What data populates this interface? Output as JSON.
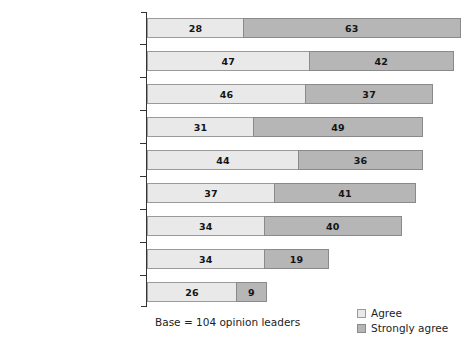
{
  "chart_data": {
    "type": "bar",
    "orientation": "horizontal",
    "stacked": true,
    "title": "",
    "subtitle": "",
    "xlabel": "",
    "ylabel": "",
    "grid": false,
    "axis_visible": "category-axis-only",
    "xlim": [
      0,
      100
    ],
    "legend_position": "bottom-right",
    "categories": [
      "Reliable products\nand services",
      "Transparency",
      "Being prepared to\nadmit mistakes",
      "Treating employees\nwell",
      "Establishing genuine\ndialogue with stakeholders",
      "Clear leadership",
      "Strong leadership",
      "Clearly defined whistle-\nblowing system",
      "Humility"
    ],
    "series": [
      {
        "name": "Agree",
        "color": "#e9e9e9",
        "values": [
          28,
          47,
          46,
          31,
          44,
          37,
          34,
          34,
          26
        ]
      },
      {
        "name": "Strongly agree",
        "color": "#b6b6b6",
        "values": [
          63,
          42,
          37,
          49,
          36,
          41,
          40,
          19,
          9
        ]
      }
    ],
    "totals": [
      91,
      89,
      83,
      80,
      80,
      78,
      74,
      53,
      35
    ],
    "annotations": {
      "base_note": "Base = 104 opinion leaders"
    }
  },
  "legend": {
    "items": [
      {
        "label": "Agree",
        "swatch": "agree"
      },
      {
        "label": "Strongly agree",
        "swatch": "strongly"
      }
    ]
  },
  "footer": {
    "base_note": "Base = 104 opinion leaders"
  }
}
